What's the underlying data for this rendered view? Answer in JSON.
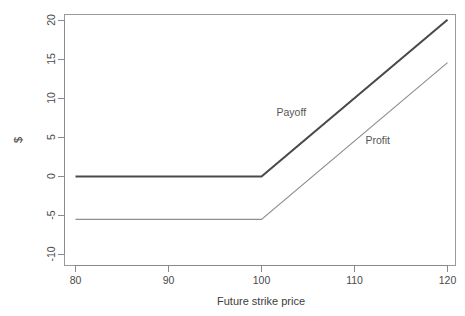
{
  "chart_data": {
    "type": "line",
    "title": "",
    "xlabel": "Future strike price",
    "ylabel": "$",
    "xlim": [
      78,
      122
    ],
    "ylim": [
      -11.5,
      21.5
    ],
    "xticks": [
      80,
      90,
      100,
      110,
      120
    ],
    "xticklabels": [
      "80",
      "90",
      "100",
      "110",
      "120"
    ],
    "yticks": [
      20,
      15,
      10,
      5,
      0,
      -5,
      -10
    ],
    "yticklabels": [
      "20",
      "15",
      "10",
      "5",
      "0",
      "-5",
      "-10"
    ],
    "grid": false,
    "legend_position": "inline-annotations",
    "series": [
      {
        "name": "Payoff",
        "color": "#4a4a4a",
        "linewidth": 2.1,
        "x": [
          80,
          100,
          120
        ],
        "values": [
          0,
          0,
          20.1
        ]
      },
      {
        "name": "Profit",
        "color": "#8f8f8f",
        "linewidth": 1.15,
        "x": [
          80,
          100,
          120
        ],
        "values": [
          -5.5,
          -5.5,
          14.6
        ]
      }
    ],
    "annotations": [
      {
        "text": "Payoff",
        "x": 103.2,
        "y": 7.8
      },
      {
        "text": "Profit",
        "x": 112.5,
        "y": 4.2
      }
    ]
  },
  "axes": {
    "x_title": "Future strike price",
    "y_title": "$",
    "x_tick_labels": [
      "80",
      "90",
      "100",
      "110",
      "120"
    ],
    "y_tick_labels": [
      "20",
      "15",
      "10",
      "5",
      "0",
      "-5",
      "-10"
    ]
  },
  "labels": {
    "payoff": "Payoff",
    "profit": "Profit"
  },
  "colors": {
    "payoff_line": "#4a4a4a",
    "profit_line": "#8f8f8f",
    "axis": "#8a8a8a",
    "background": "#ffffff"
  }
}
